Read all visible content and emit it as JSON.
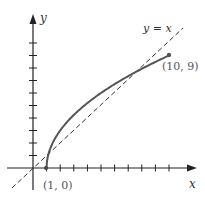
{
  "figure": {
    "axis_x_label": "x",
    "axis_y_label": "y",
    "line_label": "y = x",
    "start_point_label": "(1, 0)",
    "end_point_label": "(10, 9)",
    "colors": {
      "curve": "#555555",
      "axis": "#222222",
      "dashed": "#333333",
      "point": "#555555"
    }
  },
  "chart_data": {
    "type": "line",
    "title": "",
    "xlabel": "x",
    "ylabel": "y",
    "x_ticks": [
      1,
      2,
      3,
      4,
      5,
      6,
      7,
      8,
      9,
      10
    ],
    "y_ticks": [
      1,
      2,
      3,
      4,
      5,
      6,
      7,
      8,
      9,
      10
    ],
    "series": [
      {
        "name": "curve",
        "description": "increasing concave curve from (1,0) to (10,9)",
        "x": [
          1,
          1.25,
          2,
          3,
          4,
          5,
          6,
          7,
          8,
          9,
          10
        ],
        "y": [
          0,
          1.5,
          3,
          4.24,
          5.2,
          6,
          6.71,
          7.35,
          7.94,
          8.49,
          9
        ]
      },
      {
        "name": "y = x",
        "style": "dashed",
        "x": [
          -2,
          11.5
        ],
        "y": [
          -2,
          11.5
        ]
      }
    ],
    "points": [
      {
        "label": "(1, 0)",
        "x": 1,
        "y": 0
      },
      {
        "label": "(10, 9)",
        "x": 10,
        "y": 9
      }
    ],
    "grid": false
  }
}
